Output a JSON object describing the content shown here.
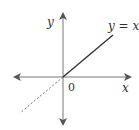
{
  "diagram": {
    "axis_x_label": "x",
    "axis_y_label": "y",
    "origin_label": "0",
    "line_label": "y = x",
    "colors": {
      "axis": "#777777",
      "line": "#333333",
      "dashed": "#777777"
    }
  }
}
